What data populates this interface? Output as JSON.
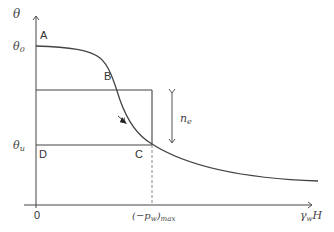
{
  "diagram": {
    "y_axis_label": "θ",
    "y_tick_top": "θ",
    "y_tick_top_sub": "0",
    "y_tick_bottom": "θ",
    "y_tick_bottom_sub": "u",
    "x_axis_label": "γ",
    "x_axis_label_sub": "w",
    "x_axis_label_tail": "H",
    "origin_label": "0",
    "x_tick_label": "(−p",
    "x_tick_label_sub": "w",
    "x_tick_label_tail": ")",
    "x_tick_label_tail_sub": "max",
    "points": {
      "A": "A",
      "B": "B",
      "C": "C",
      "D": "D"
    },
    "interval_label": "n",
    "interval_label_sub": "e"
  },
  "colors": {
    "line": "#444444",
    "dashed": "#888888"
  }
}
